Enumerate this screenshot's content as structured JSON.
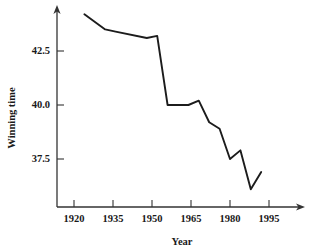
{
  "chart_data": {
    "type": "line",
    "title": "",
    "xlabel": "Year",
    "ylabel": "Winning time",
    "xlim": [
      1914,
      2000
    ],
    "ylim": [
      35.4,
      44.6
    ],
    "xticks": [
      1920,
      1935,
      1950,
      1965,
      1980,
      1995
    ],
    "xtick_labels": [
      "1920",
      "1935",
      "1950",
      "1965",
      "1980",
      "1995"
    ],
    "yticks": [
      37.5,
      40.0,
      42.5
    ],
    "ytick_labels": [
      "37.5",
      "40.0",
      "42.5"
    ],
    "grid": false,
    "legend": null,
    "line_color": "#1c1c1c",
    "axis_color": "#333333",
    "series": [
      {
        "name": "Winning time",
        "x": [
          1924,
          1932,
          1936,
          1948,
          1952,
          1956,
          1960,
          1964,
          1968,
          1972,
          1976,
          1980,
          1984,
          1988,
          1992
        ],
        "y": [
          44.2,
          43.5,
          43.4,
          43.1,
          43.2,
          40.0,
          40.0,
          40.0,
          40.2,
          39.2,
          38.9,
          37.5,
          37.9,
          36.1,
          36.9
        ]
      }
    ]
  },
  "axis": {
    "x_title": "Year",
    "y_title": "Winning time"
  }
}
